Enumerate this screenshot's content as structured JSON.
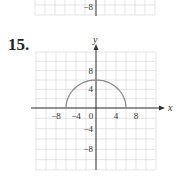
{
  "previous_problem": {
    "visible_tick_label": "−8"
  },
  "problem": {
    "number": "15.",
    "chart_data": {
      "type": "line",
      "title": "",
      "description": "Upper semicircle y = sqrt(36 - x^2)",
      "xlabel": "x",
      "ylabel": "y",
      "xlim": [
        -12,
        12
      ],
      "ylim": [
        -12,
        12
      ],
      "grid": true,
      "grid_step": 2,
      "x_ticks": [
        "−8",
        "−4",
        "0",
        "4",
        "8"
      ],
      "y_ticks": [
        "8",
        "4",
        "−4",
        "−8"
      ],
      "series": [
        {
          "name": "semicircle",
          "x": [
            -6,
            -5,
            -4,
            -3,
            -2,
            -1,
            0,
            1,
            2,
            3,
            4,
            5,
            6
          ],
          "y": [
            0,
            3.32,
            4.47,
            5.2,
            5.66,
            5.92,
            6,
            5.92,
            5.66,
            5.2,
            4.47,
            3.32,
            0
          ]
        }
      ],
      "colors": {
        "curve": "#888888",
        "grid": "#d8d8d8",
        "axes": "#333333"
      }
    }
  }
}
